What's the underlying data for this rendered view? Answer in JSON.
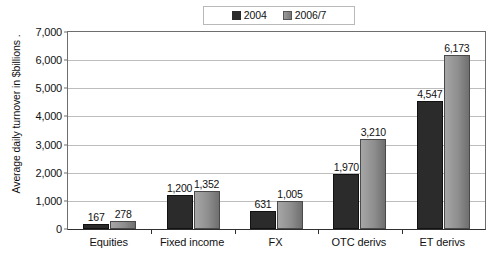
{
  "chart_data": {
    "type": "bar",
    "title": "",
    "subtitle": "",
    "xlabel": "",
    "ylabel": "Average daily turnover in $billions .",
    "categories": [
      "Equities",
      "Fixed income",
      "FX",
      "OTC derivs",
      "ET derivs"
    ],
    "series": [
      {
        "name": "2004",
        "color": "#2b2b2b",
        "values": [
          167,
          1200,
          631,
          1970,
          4547
        ],
        "labels": [
          "167",
          "1,200",
          "631",
          "1,970",
          "4,547"
        ]
      },
      {
        "name": "2006/7",
        "color": "#8e8e8e",
        "values": [
          278,
          1352,
          1005,
          3210,
          6173
        ],
        "labels": [
          "278",
          "1,352",
          "1,005",
          "3,210",
          "6,173"
        ]
      }
    ],
    "ylim": [
      0,
      7000
    ],
    "yticks": [
      0,
      1000,
      2000,
      3000,
      4000,
      5000,
      6000,
      7000
    ],
    "ytick_labels": [
      "0",
      "1,000",
      "2,000",
      "3,000",
      "4,000",
      "5,000",
      "6,000",
      "7,000"
    ],
    "grid": true,
    "legend_position": "top-center"
  },
  "legend": {
    "entries": [
      {
        "label": "2004"
      },
      {
        "label": "2006/7"
      }
    ]
  }
}
